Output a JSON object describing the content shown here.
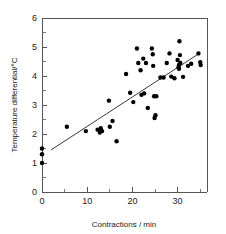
{
  "chart_data": {
    "type": "scatter",
    "title": "",
    "xlabel": "Contractions / min",
    "ylabel": "Temperature differential/°C",
    "xlim": [
      0,
      36.5
    ],
    "ylim": [
      0,
      6
    ],
    "xticks": [
      0,
      10,
      20,
      30
    ],
    "xticklabels": [
      "0",
      "10",
      "20",
      "30"
    ],
    "xticks_minor": [
      5,
      15,
      25,
      35
    ],
    "yticks": [
      0,
      1,
      2,
      3,
      4,
      5,
      6
    ],
    "yticklabels": [
      "0",
      "1",
      "2",
      "3",
      "4",
      "5",
      "6"
    ],
    "yticks_minor": [
      0.5,
      1.5,
      2.5,
      3.5,
      4.5,
      5.5
    ],
    "grid": false,
    "legend": null,
    "marker": "filled-circle",
    "marker_color": "#000000",
    "fit_line": {
      "label": "linear regression",
      "color": "#3a3a3a",
      "x_start": 2.0,
      "y_start": 1.45,
      "x_end": 35.0,
      "y_end": 4.8
    },
    "points": [
      {
        "x": 0.0,
        "y": 1.0
      },
      {
        "x": 0.0,
        "y": 1.3
      },
      {
        "x": 0.0,
        "y": 1.5
      },
      {
        "x": 5.5,
        "y": 2.25
      },
      {
        "x": 9.7,
        "y": 2.1
      },
      {
        "x": 12.3,
        "y": 2.15
      },
      {
        "x": 12.8,
        "y": 2.05
      },
      {
        "x": 13.0,
        "y": 2.2
      },
      {
        "x": 13.3,
        "y": 2.1
      },
      {
        "x": 14.8,
        "y": 3.15
      },
      {
        "x": 15.0,
        "y": 2.25
      },
      {
        "x": 15.6,
        "y": 2.45
      },
      {
        "x": 16.5,
        "y": 1.75
      },
      {
        "x": 18.6,
        "y": 4.07
      },
      {
        "x": 19.5,
        "y": 3.42
      },
      {
        "x": 20.2,
        "y": 3.1
      },
      {
        "x": 21.0,
        "y": 4.95
      },
      {
        "x": 21.3,
        "y": 4.45
      },
      {
        "x": 21.8,
        "y": 4.2
      },
      {
        "x": 22.0,
        "y": 3.35
      },
      {
        "x": 22.4,
        "y": 4.6
      },
      {
        "x": 22.6,
        "y": 3.4
      },
      {
        "x": 23.0,
        "y": 4.45
      },
      {
        "x": 23.4,
        "y": 2.9
      },
      {
        "x": 24.3,
        "y": 4.95
      },
      {
        "x": 24.5,
        "y": 4.75
      },
      {
        "x": 24.6,
        "y": 4.35
      },
      {
        "x": 24.8,
        "y": 3.3
      },
      {
        "x": 24.9,
        "y": 2.55
      },
      {
        "x": 25.1,
        "y": 2.65
      },
      {
        "x": 25.3,
        "y": 3.3
      },
      {
        "x": 26.2,
        "y": 3.95
      },
      {
        "x": 26.9,
        "y": 3.95
      },
      {
        "x": 27.6,
        "y": 4.45
      },
      {
        "x": 28.2,
        "y": 4.78
      },
      {
        "x": 28.6,
        "y": 3.98
      },
      {
        "x": 29.3,
        "y": 3.92
      },
      {
        "x": 30.0,
        "y": 4.55
      },
      {
        "x": 30.2,
        "y": 4.3
      },
      {
        "x": 30.3,
        "y": 4.38
      },
      {
        "x": 30.3,
        "y": 4.25
      },
      {
        "x": 30.4,
        "y": 5.2
      },
      {
        "x": 30.5,
        "y": 4.72
      },
      {
        "x": 30.6,
        "y": 4.45
      },
      {
        "x": 31.2,
        "y": 3.97
      },
      {
        "x": 32.3,
        "y": 4.35
      },
      {
        "x": 33.0,
        "y": 4.42
      },
      {
        "x": 34.6,
        "y": 4.78
      },
      {
        "x": 35.0,
        "y": 4.48
      },
      {
        "x": 35.1,
        "y": 4.38
      }
    ]
  }
}
